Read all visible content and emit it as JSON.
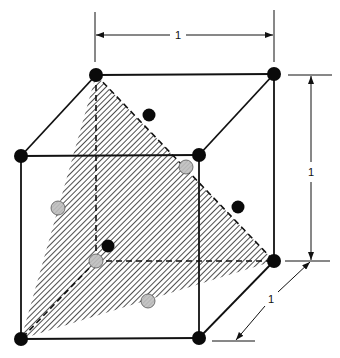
{
  "diagram": {
    "type": "fcc-unit-cell-111-plane",
    "colors": {
      "line": "#111111",
      "atom_black": "#0a0a0a",
      "atom_gray": "#bdbdbd",
      "hatch": "#222222",
      "background": "#ffffff"
    },
    "vertices": {
      "top_back_left": [
        96,
        75
      ],
      "top_back_right": [
        274,
        74
      ],
      "top_front_left": [
        21,
        156
      ],
      "top_front_right": [
        199,
        155
      ],
      "bottom_front_left": [
        21,
        339
      ],
      "bottom_front_right": [
        199,
        338
      ],
      "bottom_back_right": [
        274,
        261
      ],
      "bottom_back_left": [
        96,
        261
      ]
    },
    "shaded_plane": {
      "label": "(111) plane",
      "points": [
        [
          96,
          75
        ],
        [
          21,
          339
        ],
        [
          274,
          261
        ]
      ]
    },
    "atoms_black": [
      {
        "name": "corner-top-back-left",
        "x": 96,
        "y": 75
      },
      {
        "name": "corner-top-back-right",
        "x": 274,
        "y": 74
      },
      {
        "name": "corner-top-front-left",
        "x": 21,
        "y": 156
      },
      {
        "name": "corner-top-front-right",
        "x": 199,
        "y": 155
      },
      {
        "name": "corner-bottom-front-left",
        "x": 21,
        "y": 339
      },
      {
        "name": "corner-bottom-front-right",
        "x": 199,
        "y": 338
      },
      {
        "name": "corner-bottom-back-right",
        "x": 274,
        "y": 261
      },
      {
        "name": "face-top",
        "x": 149,
        "y": 115
      },
      {
        "name": "face-right",
        "x": 238,
        "y": 207
      },
      {
        "name": "face-back-interior",
        "x": 108,
        "y": 246
      }
    ],
    "atoms_gray": [
      {
        "name": "corner-bottom-back-left-hidden",
        "x": 96,
        "y": 261
      },
      {
        "name": "face-front-upper",
        "x": 186,
        "y": 167
      },
      {
        "name": "face-left",
        "x": 58,
        "y": 208
      },
      {
        "name": "face-bottom",
        "x": 148,
        "y": 301
      }
    ],
    "dimensions": {
      "width": {
        "label": "1"
      },
      "height": {
        "label": "1"
      },
      "depth": {
        "label": "1"
      }
    }
  }
}
